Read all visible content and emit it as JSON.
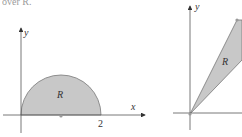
{
  "header_text": "over R.",
  "figure_left": {
    "region_label": "R",
    "y_axis_label": "y",
    "x_axis_label": "x",
    "tick_label": "2",
    "shape": "semicircular disk"
  },
  "figure_right": {
    "region_label": "R",
    "y_axis_label": "y",
    "shape": "triangular wedge from origin"
  },
  "colors": {
    "fill": "#c8c8c8",
    "stroke": "#666666",
    "axis": "#555555"
  }
}
